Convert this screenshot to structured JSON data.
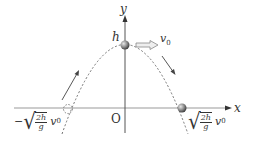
{
  "diagram": {
    "axes": {
      "x_label": "x",
      "y_label": "y",
      "origin_label": "O"
    },
    "apex": {
      "height_label": "h",
      "velocity_label": "v",
      "velocity_sub": "0"
    },
    "right_intercept": {
      "num": "2h",
      "den": "g",
      "v": "v",
      "sub": "0",
      "sign": ""
    },
    "left_intercept": {
      "num": "2h",
      "den": "g",
      "v": "v",
      "sub": "0",
      "sign": "−"
    },
    "colors": {
      "axis": "#555555",
      "curve": "#666666",
      "ball": "#8a8a8a",
      "arrow": "#444444"
    }
  }
}
